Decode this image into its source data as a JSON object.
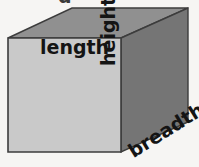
{
  "figure": {
    "type": "cuboid-dimension-diagram",
    "shape_name": "cuboid",
    "labels": {
      "length": "length",
      "height": "height",
      "breadth": "breadth"
    },
    "cropped_text_fragment": "g",
    "colors": {
      "background": "#f6f5f3",
      "front_face": "#c9c9c9",
      "top_face": "#909090",
      "right_face": "#757575",
      "outline": "#3c3c3c",
      "label_text": "#141414"
    },
    "geometry": {
      "front_face_points": "8,38 121,38 121,152 8,152",
      "top_face_points": "8,38 72,8 188,8 121,38",
      "right_face_points": "121,38 188,8 188,122 121,152"
    }
  }
}
